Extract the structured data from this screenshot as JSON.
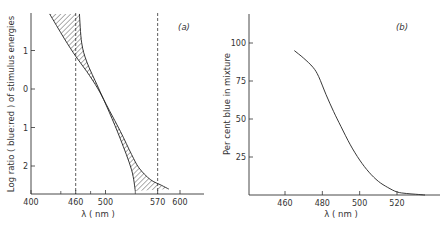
{
  "chart_data": [
    {
      "panel": "a",
      "type": "area",
      "panel_label": "(a)",
      "title": "",
      "xlabel": "λ ( nm )",
      "ylabel": "Log ratio ( blue:red ) of stimulus energies",
      "x_ticks": [
        "400",
        "460",
        "500",
        "570",
        "600"
      ],
      "x_tick_values": [
        400,
        460,
        500,
        570,
        600
      ],
      "y_ticks": [
        "1",
        "0",
        "1",
        "2"
      ],
      "y_tick_values": [
        1,
        0,
        -1,
        -2
      ],
      "xlim": [
        400,
        620
      ],
      "ylim": [
        -2.7,
        1.95
      ],
      "reference_lines": [
        {
          "orientation": "vertical",
          "x": 460,
          "style": "dashed"
        },
        {
          "orientation": "vertical",
          "x": 570,
          "style": "dashed"
        }
      ],
      "series": [
        {
          "name": "lower boundary",
          "x": [
            425,
            445,
            460,
            475,
            490,
            505,
            520,
            535,
            545,
            560,
            575,
            585
          ],
          "y": [
            1.95,
            1.3,
            0.85,
            0.45,
            0.0,
            -0.55,
            -1.1,
            -1.7,
            -2.05,
            -2.35,
            -2.5,
            -2.6
          ]
        },
        {
          "name": "upper boundary",
          "x": [
            465,
            468,
            475,
            490,
            505,
            520,
            535,
            540
          ],
          "y": [
            1.95,
            1.2,
            0.7,
            0.05,
            -0.6,
            -1.3,
            -2.1,
            -2.65
          ]
        }
      ],
      "shaded_region": "hatched area between lower and upper boundary"
    },
    {
      "panel": "b",
      "type": "line",
      "panel_label": "(b)",
      "title": "",
      "xlabel": "λ ( nm )",
      "ylabel": "Per cent blue in mixture",
      "x_ticks": [
        "460",
        "480",
        "500",
        "520"
      ],
      "x_tick_values": [
        460,
        480,
        500,
        520
      ],
      "y_ticks": [
        "100",
        "75",
        "50",
        "25"
      ],
      "y_tick_values": [
        100,
        75,
        50,
        25
      ],
      "xlim": [
        441,
        544
      ],
      "ylim": [
        0,
        120
      ],
      "series": [
        {
          "name": "per cent blue",
          "x": [
            465,
            470,
            475,
            478,
            482,
            486,
            490,
            495,
            500,
            505,
            510,
            515,
            520,
            525,
            530,
            535
          ],
          "y": [
            95,
            90,
            84,
            78,
            66,
            55,
            45,
            33,
            23,
            15,
            9,
            5,
            2,
            1,
            0.5,
            0
          ]
        }
      ]
    }
  ]
}
